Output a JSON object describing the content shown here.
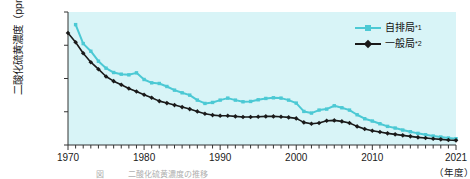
{
  "chart_data": {
    "type": "line",
    "title": "",
    "subtitle": "",
    "xlabel": "（年度）",
    "ylabel": "二酸化硫黄濃度（ppm）",
    "xlim": [
      1970,
      2021
    ],
    "ylim": [
      0,
      0.04
    ],
    "grid": false,
    "legend_position": "top-right",
    "y_ticks": [
      "0",
      "0.010",
      "0.020",
      "0.030",
      "0.040"
    ],
    "y_tick_values": [
      0,
      0.01,
      0.02,
      0.03,
      0.04
    ],
    "x_ticks": [
      "1970",
      "1980",
      "1990",
      "2000",
      "2010",
      "2021"
    ],
    "x_tick_values": [
      1970,
      1980,
      1990,
      2000,
      2010,
      2021
    ],
    "x_minor_tick_interval": 1,
    "plot_background": "#d8f4f7",
    "x": [
      1970,
      1971,
      1972,
      1973,
      1974,
      1975,
      1976,
      1977,
      1978,
      1979,
      1980,
      1981,
      1982,
      1983,
      1984,
      1985,
      1986,
      1987,
      1988,
      1989,
      1990,
      1991,
      1992,
      1993,
      1994,
      1995,
      1996,
      1997,
      1998,
      1999,
      2000,
      2001,
      2002,
      2003,
      2004,
      2005,
      2006,
      2007,
      2008,
      2009,
      2010,
      2011,
      2012,
      2013,
      2014,
      2015,
      2016,
      2017,
      2018,
      2019,
      2020,
      2021
    ],
    "series": [
      {
        "name": "自排局",
        "note": "*1",
        "color": "#4cc9d4",
        "marker": "square",
        "values": [
          null,
          0.0362,
          0.0305,
          0.0282,
          0.0252,
          0.0231,
          0.0218,
          0.0213,
          0.0211,
          0.0217,
          0.0197,
          0.0187,
          0.0185,
          0.0176,
          0.0165,
          0.0157,
          0.015,
          0.0135,
          0.0125,
          0.0128,
          0.0135,
          0.0141,
          0.0135,
          0.013,
          0.0131,
          0.0136,
          0.014,
          0.0142,
          0.0141,
          0.0135,
          0.0126,
          0.0101,
          0.0096,
          0.0105,
          0.0108,
          0.0118,
          0.0112,
          0.0105,
          0.0091,
          0.0079,
          0.0072,
          0.0064,
          0.0056,
          0.0051,
          0.0045,
          0.004,
          0.0035,
          0.0031,
          0.0027,
          0.0024,
          0.0021,
          0.0019
        ]
      },
      {
        "name": "一般局",
        "note": "*2",
        "color": "#1a1a1a",
        "marker": "diamond",
        "values": [
          0.0337,
          0.0309,
          0.0276,
          0.0249,
          0.0228,
          0.0206,
          0.0192,
          0.0181,
          0.017,
          0.0161,
          0.0151,
          0.0142,
          0.0132,
          0.0126,
          0.012,
          0.0114,
          0.0108,
          0.0101,
          0.0094,
          0.009,
          0.0088,
          0.0088,
          0.0086,
          0.0084,
          0.0084,
          0.0085,
          0.0086,
          0.0086,
          0.0085,
          0.0083,
          0.008,
          0.0068,
          0.0064,
          0.0066,
          0.0073,
          0.0074,
          0.0071,
          0.0066,
          0.0056,
          0.0048,
          0.0043,
          0.0039,
          0.0035,
          0.0032,
          0.0029,
          0.0026,
          0.0023,
          0.0021,
          0.0019,
          0.0017,
          0.0015,
          0.0014
        ]
      }
    ]
  },
  "axis": {
    "y_label": "二酸化硫黄濃度（ppm）",
    "x_unit_label": "（年度）"
  },
  "legend": {
    "items": [
      {
        "label": "自排局",
        "note": "*1",
        "color": "#4cc9d4"
      },
      {
        "label": "一般局",
        "note": "*2",
        "color": "#1a1a1a"
      }
    ]
  },
  "caption": {
    "text": "図　　　二酸化硫黄濃度の推移"
  }
}
